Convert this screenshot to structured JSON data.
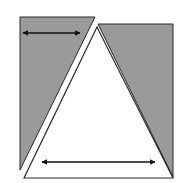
{
  "diagram": {
    "colors": {
      "background": "#ffffff",
      "shaded": "#9a9a9a",
      "stroke": "#2a2a2a",
      "triangle_fill": "#ffffff"
    },
    "shapes": {
      "left_shaded_piece": {
        "points": "20,17 95,17 20,170"
      },
      "right_shaded_piece": {
        "points": "98,24 173,24 173,177"
      },
      "white_triangle": {
        "points": "97,27 24,178 173,178"
      }
    },
    "arrows": [
      {
        "name": "top-width-arrow",
        "x1": 23,
        "y1": 33,
        "x2": 80,
        "y2": 33
      },
      {
        "name": "base-width-arrow",
        "x1": 42,
        "y1": 162,
        "x2": 155,
        "y2": 162
      }
    ]
  }
}
